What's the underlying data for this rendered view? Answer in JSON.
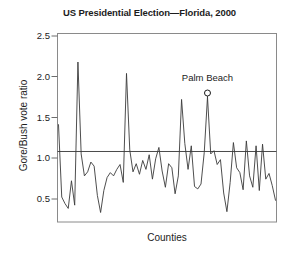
{
  "chart_data": {
    "type": "line",
    "title": "US Presidential Election—Florida, 2000",
    "subtitle": "",
    "xlabel": "Counties",
    "ylabel": "Gore/Bush vote ratio",
    "xlim": [
      0,
      68
    ],
    "ylim": [
      0.22,
      2.62
    ],
    "grid": false,
    "legend_position": "none",
    "y_ticks": [
      "0.5",
      "1.0",
      "1.5",
      "2.0",
      "2.5"
    ],
    "y_tick_values": [
      0.5,
      1.0,
      1.5,
      2.0,
      2.5
    ],
    "x_ticks": [],
    "x_tick_values": [],
    "reference_line": {
      "orientation": "horizontal",
      "value": 1.08,
      "label": ""
    },
    "annotations": [
      {
        "text": "Palm Beach",
        "point_index": 46,
        "x": 46,
        "y": 1.75,
        "marker": "open-circle"
      }
    ],
    "series": [
      {
        "name": "Gore/Bush vote ratio by county",
        "color": "#3a3a3a",
        "x": [
          0,
          1,
          2,
          3,
          4,
          5,
          6,
          7,
          8,
          9,
          10,
          11,
          12,
          13,
          14,
          15,
          16,
          17,
          18,
          19,
          20,
          21,
          22,
          23,
          24,
          25,
          26,
          27,
          28,
          29,
          30,
          31,
          32,
          33,
          34,
          35,
          36,
          37,
          38,
          39,
          40,
          41,
          42,
          43,
          44,
          45,
          46,
          47,
          48,
          49,
          50,
          51,
          52,
          53,
          54,
          55,
          56,
          57,
          58,
          59,
          60,
          61,
          62,
          63,
          64,
          65,
          66,
          67
        ],
        "values": [
          1.41,
          0.52,
          0.44,
          0.38,
          0.72,
          0.42,
          2.18,
          1.05,
          0.78,
          0.83,
          0.95,
          0.9,
          0.54,
          0.33,
          0.6,
          0.76,
          0.82,
          0.78,
          0.86,
          0.92,
          0.7,
          2.04,
          1.1,
          0.83,
          0.93,
          0.8,
          0.97,
          0.86,
          1.04,
          0.74,
          0.99,
          1.13,
          0.84,
          0.64,
          0.93,
          0.88,
          0.56,
          0.78,
          1.72,
          1.18,
          0.86,
          1.15,
          0.65,
          0.62,
          0.68,
          1.07,
          1.75,
          1.05,
          1.09,
          0.92,
          0.98,
          0.57,
          0.34,
          0.7,
          1.19,
          0.88,
          0.82,
          0.61,
          1.21,
          0.78,
          0.64,
          1.15,
          0.6,
          1.17,
          0.74,
          0.81,
          0.66,
          0.48
        ]
      }
    ]
  }
}
